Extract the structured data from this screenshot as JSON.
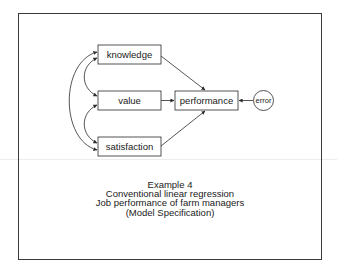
{
  "diagram": {
    "type": "path-model",
    "nodes": {
      "knowledge": {
        "label": "knowledge",
        "shape": "rect"
      },
      "value": {
        "label": "value",
        "shape": "rect"
      },
      "satisfaction": {
        "label": "satisfaction",
        "shape": "rect"
      },
      "performance": {
        "label": "performance",
        "shape": "rect"
      },
      "error": {
        "label": "error",
        "shape": "circle"
      }
    },
    "edges": [
      {
        "from": "knowledge",
        "to": "performance",
        "type": "directed"
      },
      {
        "from": "value",
        "to": "performance",
        "type": "directed"
      },
      {
        "from": "satisfaction",
        "to": "performance",
        "type": "directed"
      },
      {
        "from": "error",
        "to": "performance",
        "type": "directed"
      },
      {
        "from": "knowledge",
        "to": "value",
        "type": "covariance"
      },
      {
        "from": "value",
        "to": "satisfaction",
        "type": "covariance"
      },
      {
        "from": "knowledge",
        "to": "satisfaction",
        "type": "covariance"
      }
    ]
  },
  "caption": {
    "line1": "Example 4",
    "line2": "Conventional linear regression",
    "line3": "Job performance of farm managers",
    "line4": "(Model Specification)"
  },
  "colors": {
    "line": "#2a2a2a",
    "background": "#ffffff"
  }
}
